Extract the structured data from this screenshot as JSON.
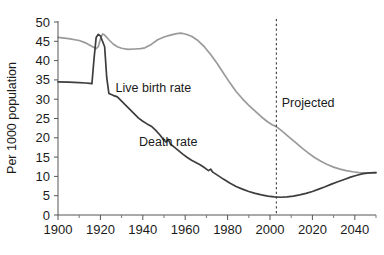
{
  "chart_data": {
    "type": "line",
    "title": "",
    "subtitle": "",
    "xlabel": "",
    "ylabel": "Per 1000 population",
    "xlim": [
      1900,
      2050
    ],
    "ylim": [
      0,
      50
    ],
    "grid": false,
    "legend_position": "inline-annotations",
    "x_ticks": [
      1900,
      1920,
      1940,
      1960,
      1980,
      2000,
      2020,
      2040
    ],
    "x_tick_labels": [
      "1900",
      "1920",
      "1940",
      "1960",
      "1980",
      "2000",
      "2020",
      "2040"
    ],
    "x_minor_ticks": [
      1910,
      1930,
      1950,
      1970,
      1990,
      2010,
      2030,
      2050
    ],
    "y_ticks": [
      0,
      5,
      10,
      15,
      20,
      25,
      30,
      35,
      40,
      45,
      50
    ],
    "y_tick_labels": [
      "0",
      "5",
      "10",
      "15",
      "20",
      "25",
      "30",
      "35",
      "40",
      "45",
      "50"
    ],
    "series": [
      {
        "name": "Live birth rate",
        "color": "#9a9a9a",
        "label_x": 1945,
        "label_y": 33,
        "points": [
          [
            1900,
            46.0
          ],
          [
            1905,
            45.7
          ],
          [
            1910,
            45.2
          ],
          [
            1913,
            44.6
          ],
          [
            1915,
            44.0
          ],
          [
            1917,
            43.4
          ],
          [
            1918,
            43.1
          ],
          [
            1919,
            43.6
          ],
          [
            1920,
            45.6
          ],
          [
            1921,
            46.9
          ],
          [
            1922,
            46.6
          ],
          [
            1924,
            45.4
          ],
          [
            1926,
            44.3
          ],
          [
            1928,
            43.6
          ],
          [
            1930,
            43.2
          ],
          [
            1933,
            42.9
          ],
          [
            1936,
            43.0
          ],
          [
            1939,
            43.1
          ],
          [
            1941,
            43.3
          ],
          [
            1944,
            44.2
          ],
          [
            1947,
            45.4
          ],
          [
            1950,
            46.1
          ],
          [
            1953,
            46.6
          ],
          [
            1956,
            47.0
          ],
          [
            1958,
            47.1
          ],
          [
            1960,
            46.9
          ],
          [
            1963,
            46.3
          ],
          [
            1966,
            45.2
          ],
          [
            1969,
            43.6
          ],
          [
            1972,
            41.6
          ],
          [
            1975,
            39.3
          ],
          [
            1978,
            36.8
          ],
          [
            1981,
            34.3
          ],
          [
            1984,
            32.0
          ],
          [
            1987,
            30.1
          ],
          [
            1990,
            28.4
          ],
          [
            1993,
            26.9
          ],
          [
            1996,
            25.4
          ],
          [
            1999,
            24.1
          ],
          [
            2001,
            23.4
          ],
          [
            2003,
            22.9
          ],
          [
            2006,
            21.6
          ],
          [
            2009,
            20.2
          ],
          [
            2012,
            18.8
          ],
          [
            2015,
            17.4
          ],
          [
            2018,
            16.1
          ],
          [
            2021,
            14.9
          ],
          [
            2024,
            13.9
          ],
          [
            2027,
            13.1
          ],
          [
            2030,
            12.4
          ],
          [
            2033,
            11.9
          ],
          [
            2036,
            11.5
          ],
          [
            2039,
            11.2
          ],
          [
            2042,
            11.0
          ],
          [
            2045,
            10.9
          ],
          [
            2048,
            10.9
          ],
          [
            2050,
            11.0
          ]
        ]
      },
      {
        "name": "Death rate",
        "color": "#3d3d3d",
        "label_x": 1952,
        "label_y": 19,
        "points": [
          [
            1900,
            34.5
          ],
          [
            1905,
            34.4
          ],
          [
            1910,
            34.3
          ],
          [
            1913,
            34.2
          ],
          [
            1915,
            34.1
          ],
          [
            1916,
            34.0
          ],
          [
            1917,
            40.5
          ],
          [
            1918,
            46.0
          ],
          [
            1919,
            46.8
          ],
          [
            1920,
            46.4
          ],
          [
            1921,
            45.0
          ],
          [
            1922,
            43.6
          ],
          [
            1923,
            35.5
          ],
          [
            1924,
            31.5
          ],
          [
            1926,
            31.0
          ],
          [
            1928,
            30.6
          ],
          [
            1930,
            29.5
          ],
          [
            1932,
            28.4
          ],
          [
            1934,
            27.3
          ],
          [
            1936,
            26.2
          ],
          [
            1938,
            25.1
          ],
          [
            1940,
            24.3
          ],
          [
            1942,
            23.6
          ],
          [
            1944,
            23.0
          ],
          [
            1946,
            22.0
          ],
          [
            1948,
            20.8
          ],
          [
            1950,
            19.4
          ],
          [
            1951,
            18.9
          ],
          [
            1952,
            19.6
          ],
          [
            1953,
            18.4
          ],
          [
            1955,
            17.5
          ],
          [
            1957,
            16.6
          ],
          [
            1959,
            15.7
          ],
          [
            1961,
            14.9
          ],
          [
            1963,
            14.2
          ],
          [
            1965,
            13.6
          ],
          [
            1967,
            13.0
          ],
          [
            1969,
            12.3
          ],
          [
            1970,
            11.9
          ],
          [
            1971,
            11.5
          ],
          [
            1972,
            11.9
          ],
          [
            1973,
            11.1
          ],
          [
            1975,
            10.4
          ],
          [
            1978,
            9.3
          ],
          [
            1981,
            8.3
          ],
          [
            1984,
            7.4
          ],
          [
            1987,
            6.7
          ],
          [
            1990,
            6.1
          ],
          [
            1993,
            5.6
          ],
          [
            1996,
            5.2
          ],
          [
            1999,
            4.9
          ],
          [
            2002,
            4.7
          ],
          [
            2005,
            4.6
          ],
          [
            2008,
            4.7
          ],
          [
            2011,
            4.9
          ],
          [
            2014,
            5.2
          ],
          [
            2017,
            5.6
          ],
          [
            2020,
            6.1
          ],
          [
            2023,
            6.7
          ],
          [
            2026,
            7.3
          ],
          [
            2029,
            8.0
          ],
          [
            2032,
            8.6
          ],
          [
            2035,
            9.2
          ],
          [
            2038,
            9.8
          ],
          [
            2041,
            10.3
          ],
          [
            2044,
            10.7
          ],
          [
            2047,
            10.9
          ],
          [
            2050,
            11.0
          ]
        ]
      }
    ],
    "annotations": [
      {
        "name": "birth-rate-label",
        "text": "Live birth rate",
        "x": 1945,
        "y": 33
      },
      {
        "name": "death-rate-label",
        "text": "Death rate",
        "x": 1952,
        "y": 19
      },
      {
        "name": "projected-label",
        "text": "Projected",
        "x": 2018,
        "y": 29
      }
    ],
    "projection_marker": {
      "name": "projection-divider",
      "label": "Projected",
      "x": 2003,
      "style": "dashed-vertical"
    }
  }
}
